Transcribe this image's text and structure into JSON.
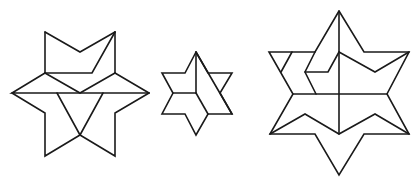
{
  "diagram": {
    "type": "geometric-line-drawing",
    "stroke_color": "#1a1a1a",
    "background_color": "#ffffff",
    "figures": [
      {
        "id": "star-left",
        "segments": [
          "M45,32 L80,52 L115,32",
          "M45,32 L45,73",
          "M115,32 L115,73",
          "M115,32 L92,73 L45,73",
          "M45,73 L80,93 L115,73",
          "M45,73 L12,93 L149,93",
          "M115,73 L149,93",
          "M12,93 L45,113 L45,156 L80,135 L115,156 L115,113 L149,93",
          "M57,93 L80,135",
          "M103,93 L80,135"
        ]
      },
      {
        "id": "star-middle",
        "segments": [
          "M196,52 L185,73 L162,73 L173,93 L162,114 L185,114 L196,135 L208,114 L232,114 L220,93 L232,73 L208,73 L196,52",
          "M196,52 L196,93",
          "M173,93 L196,93",
          "M196,52 L232,114",
          "M196,93 L208,114"
        ]
      },
      {
        "id": "star-right",
        "segments": [
          "M339,11 L315,52 L269,52 L293,94 L270,134 L315,134 L339,175 L364,134 L409,134 L387,94 L409,52 L364,52 L339,11",
          "M339,11 L339,134",
          "M292,52 L281,72",
          "M293,94 L387,94",
          "M315,52 L305,72 L316,94",
          "M305,72 L328,72 L339,52",
          "M339,52 L375,72 L409,52",
          "M270,134 L305,114 L339,134 L375,114 L409,134"
        ]
      }
    ]
  }
}
